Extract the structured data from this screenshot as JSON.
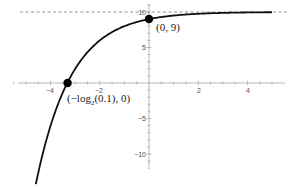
{
  "chart_data": {
    "type": "line",
    "title": "",
    "xlabel": "",
    "ylabel": "",
    "function": "y = 10 - 2^(-x)",
    "xlim": [
      -5.5,
      5.6
    ],
    "ylim": [
      -12.6,
      11.7
    ],
    "grid": false,
    "legend": null,
    "x_ticks": [
      -4,
      -2,
      2,
      4
    ],
    "x_tick_labels": [
      "-4",
      "-2",
      "2",
      "4"
    ],
    "y_ticks": [
      -10,
      -5,
      5,
      10
    ],
    "y_tick_labels": [
      "-10",
      "-5",
      "5",
      "10"
    ],
    "asymptote": {
      "y": 10,
      "style": "dashed"
    },
    "curve": {
      "x_start": -4.6,
      "x_end": 5,
      "x": [
        -4.6,
        -4.0,
        -3.5,
        -3.32,
        -3.0,
        -2.5,
        -2.0,
        -1.5,
        -1.0,
        -0.5,
        0,
        0.5,
        1,
        1.5,
        2,
        3,
        4,
        5
      ],
      "y": [
        -14.25,
        -6.0,
        -1.31,
        0.0,
        2.0,
        4.34,
        6.0,
        7.17,
        8.0,
        8.59,
        9.0,
        9.29,
        9.5,
        9.65,
        9.75,
        9.875,
        9.94,
        9.97
      ]
    },
    "points": [
      {
        "x": 0,
        "y": 9,
        "label": "(0, 9)"
      },
      {
        "x": -3.3219,
        "y": 0,
        "label_prefix": "(−log",
        "label_sub": "2",
        "label_suffix": "(0.1), 0)"
      }
    ],
    "annotations": [
      {
        "text": "(0, 9)",
        "near_point": 0
      },
      {
        "text": "(−log₂(0.1), 0)",
        "near_point": 1
      }
    ]
  },
  "labels": {
    "point_a": "(0, 9)",
    "point_b_prefix": "(−log",
    "point_b_sub": "2",
    "point_b_suffix": "(0.1), 0)",
    "xt0": "−4",
    "xt1": "−2",
    "xt2": "2",
    "xt3": "4",
    "yt0": "10",
    "yt1": "5",
    "yt2": "−5",
    "yt3": "−10"
  }
}
